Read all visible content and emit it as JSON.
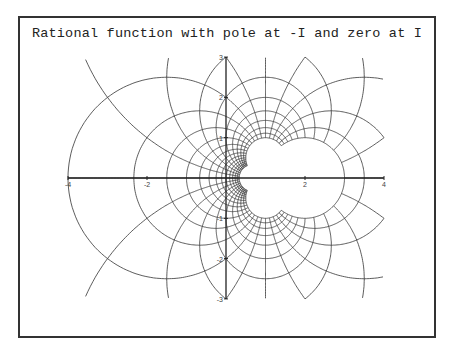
{
  "plot": {
    "title": "Rational function with pole at -I and zero at I"
  },
  "chart_data": {
    "type": "line",
    "title": "Rational function with pole at -I and zero at I",
    "function": "(z - I)/(z + I)",
    "pole": "-I",
    "zero": "I",
    "xlabel": "",
    "ylabel": "",
    "xlim": [
      -4,
      4
    ],
    "ylim": [
      -3,
      3
    ],
    "x_ticks": [
      -4,
      -2,
      2,
      4
    ],
    "x_tick_labels": [
      "-4",
      "-2",
      "2",
      "4"
    ],
    "y_ticks": [
      -3,
      -2,
      -1,
      1,
      2,
      3
    ],
    "y_tick_labels": [
      "-3",
      "-2",
      "-1",
      "1",
      "2",
      "3"
    ],
    "grid": false,
    "legend": null
  },
  "colors": {
    "curve": "#333333",
    "axis": "#222222",
    "frame": "#333333",
    "background": "#ffffff"
  }
}
